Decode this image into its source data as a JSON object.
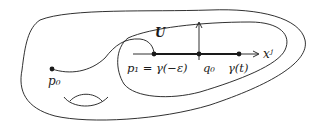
{
  "diagram": {
    "colors": {
      "stroke": "#1a1a1a",
      "background": "#ffffff"
    },
    "regions": {
      "manifold": {
        "name": "M"
      },
      "neighborhood": {
        "label": "U"
      }
    },
    "points": {
      "p0": {
        "label": "p₀"
      },
      "p1": {
        "label": "p₁ = γ(−ε)"
      },
      "q0": {
        "label": "q₀"
      },
      "gamma_t": {
        "label": "γ(t)"
      }
    },
    "axis": {
      "label": "xʲ"
    }
  }
}
